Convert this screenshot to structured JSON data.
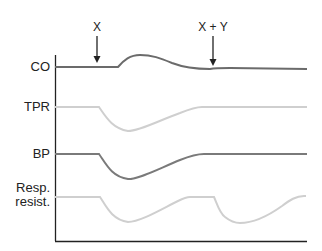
{
  "diagram": {
    "type": "physiological-response-traces",
    "events": [
      {
        "label": "X",
        "x": 97
      },
      {
        "label": "X + Y",
        "x": 213
      }
    ],
    "traces": [
      {
        "label": "CO",
        "color": "#6b6b6b"
      },
      {
        "label": "TPR",
        "color": "#cfcfcf"
      },
      {
        "label": "BP",
        "color": "#7a7a7a"
      },
      {
        "label": "Resp. resist.",
        "label_line1": "Resp.",
        "label_line2": "resist.",
        "color": "#cfcfcf"
      }
    ],
    "axis_color": "#222222",
    "arrow_color": "#222222"
  }
}
